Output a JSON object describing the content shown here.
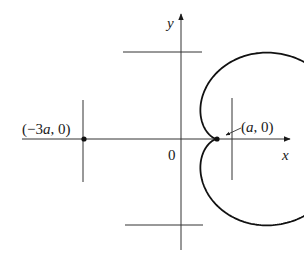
{
  "figure": {
    "type": "polar curve (cardioid) with horizontal and vertical tangent lines",
    "axes": {
      "x_label": "x",
      "y_label": "y",
      "origin_label": "0"
    },
    "points": [
      {
        "label_pre": "(−3",
        "label_var": "a",
        "label_post": ", 0)"
      },
      {
        "label_pre": "(",
        "label_var": "a",
        "label_post": ", 0)"
      }
    ],
    "tangent_lines": [
      "top horizontal",
      "bottom horizontal",
      "left vertical",
      "right vertical"
    ],
    "colors": {
      "stroke": "#1a1a1a",
      "background": "#ffffff"
    }
  }
}
